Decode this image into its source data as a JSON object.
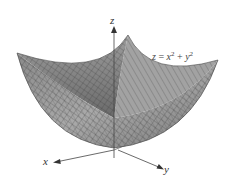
{
  "figure": {
    "type": "3d-surface",
    "surface": "paraboloid",
    "equation": {
      "lhs": "z",
      "eq": " = ",
      "term1_base": "x",
      "term1_exp": "2",
      "plus": " + ",
      "term2_base": "y",
      "term2_exp": "2"
    },
    "axes": {
      "x": "x",
      "y": "y",
      "z": "z"
    },
    "colors": {
      "surface_light": "#b8b8b8",
      "surface_dark": "#6e6e6e",
      "mesh": "#3a3a3a",
      "axis": "#444444",
      "background": "#ffffff"
    }
  }
}
